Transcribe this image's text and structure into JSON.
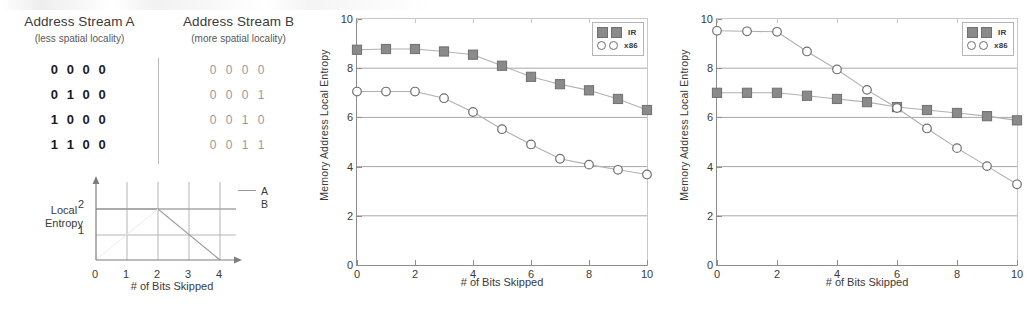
{
  "left_panel": {
    "streams": {
      "columns": [
        {
          "title": "Address Stream A",
          "subtitle": "(less spatial locality)"
        },
        {
          "title": "Address Stream B",
          "subtitle": "(more spatial locality)"
        }
      ],
      "rows": [
        {
          "a": "0 0 0 0",
          "b": "0 0 0 0"
        },
        {
          "a": "0 1 0 0",
          "b": "0 0 0 1"
        },
        {
          "a": "1 0 0 0",
          "b": "0 0 1 0"
        },
        {
          "a": "1 1 0 0",
          "b": "0 0 1 1"
        }
      ]
    },
    "schematic": {
      "ylabel_line1": "Local",
      "ylabel_line2": "Entropy",
      "xlabel": "# of Bits Skipped",
      "xticks": [
        "0",
        "1",
        "2",
        "3",
        "4"
      ],
      "yticks": [
        "1",
        "2"
      ],
      "legend": [
        "A",
        "B"
      ]
    }
  },
  "charts": [
    {
      "id": "chart-middle",
      "xlabel": "# of Bits Skipped",
      "ylabel": "Memory Address Local Entropy",
      "legend": [
        {
          "label": "IR",
          "marker": "filled-square"
        },
        {
          "label": "x86",
          "marker": "open-circle"
        }
      ]
    },
    {
      "id": "chart-right",
      "xlabel": "# of Bits Skipped",
      "ylabel": "Memory Address Local Entropy",
      "legend": [
        {
          "label": "IR",
          "marker": "filled-square"
        },
        {
          "label": "x86",
          "marker": "open-circle"
        }
      ]
    }
  ],
  "chart_data": [
    {
      "type": "line",
      "chart_id": "schematic-local-entropy",
      "title": "",
      "xlabel": "# of Bits Skipped",
      "ylabel": "Local Entropy",
      "x": [
        0,
        1,
        2,
        3,
        4
      ],
      "xlim": [
        0,
        4.4
      ],
      "ylim": [
        0,
        2.4
      ],
      "xticks": [
        0,
        1,
        2,
        3,
        4
      ],
      "yticks": [
        1,
        2
      ],
      "grid": true,
      "legend_position": "top-right",
      "series": [
        {
          "name": "A",
          "values": [
            2,
            2,
            2,
            2,
            2
          ]
        },
        {
          "name": "B",
          "values": [
            2,
            2,
            2,
            1,
            0
          ]
        }
      ]
    },
    {
      "type": "line",
      "chart_id": "chart-middle",
      "title": "",
      "xlabel": "# of Bits Skipped",
      "ylabel": "Memory Address Local Entropy",
      "x": [
        0,
        1,
        2,
        3,
        4,
        5,
        6,
        7,
        8,
        9,
        10
      ],
      "xlim": [
        0,
        10
      ],
      "ylim": [
        0,
        10
      ],
      "xticks": [
        0,
        2,
        4,
        6,
        8,
        10
      ],
      "yticks": [
        0,
        2,
        4,
        6,
        8,
        10
      ],
      "grid": true,
      "legend_position": "top-right",
      "series": [
        {
          "name": "IR",
          "marker": "filled-square",
          "values": [
            8.75,
            8.78,
            8.78,
            8.68,
            8.55,
            8.1,
            7.65,
            7.35,
            7.1,
            6.75,
            6.3
          ]
        },
        {
          "name": "x86",
          "marker": "open-circle",
          "values": [
            7.05,
            7.05,
            7.05,
            6.78,
            6.22,
            5.52,
            4.9,
            4.32,
            4.08,
            3.87,
            3.68
          ]
        }
      ]
    },
    {
      "type": "line",
      "chart_id": "chart-right",
      "title": "",
      "xlabel": "# of Bits Skipped",
      "ylabel": "Memory Address Local Entropy",
      "x": [
        0,
        1,
        2,
        3,
        4,
        5,
        6,
        7,
        8,
        9,
        10
      ],
      "xlim": [
        0,
        10
      ],
      "ylim": [
        0,
        10
      ],
      "xticks": [
        0,
        2,
        4,
        6,
        8,
        10
      ],
      "yticks": [
        0,
        2,
        4,
        6,
        8,
        10
      ],
      "grid": true,
      "legend_position": "top-right",
      "series": [
        {
          "name": "IR",
          "marker": "filled-square",
          "values": [
            7.0,
            7.0,
            7.0,
            6.88,
            6.75,
            6.62,
            6.42,
            6.3,
            6.18,
            6.05,
            5.88
          ]
        },
        {
          "name": "x86",
          "marker": "open-circle",
          "values": [
            9.52,
            9.5,
            9.48,
            8.68,
            7.95,
            7.12,
            6.38,
            5.55,
            4.75,
            4.02,
            3.28
          ]
        }
      ]
    }
  ],
  "colors": {
    "marker_fill": "#8a8a8a",
    "marker_edge": "#6f6f6f",
    "line": "#b0b0b0",
    "grid": "#a8a8a8",
    "axis": "#8d8d8d",
    "text": "#3a3a3a",
    "background": "#ffffff"
  }
}
